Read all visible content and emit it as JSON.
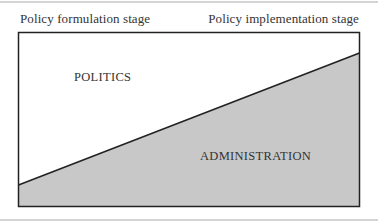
{
  "diagram": {
    "left_header": "Policy formulation stage",
    "right_header": "Policy implementation stage",
    "upper_region_label": "POLITICS",
    "lower_region_label": "ADMINISTRATION",
    "colors": {
      "upper_fill": "#ffffff",
      "lower_fill": "#c8c8c8",
      "border": "#222222",
      "rule": "#d4d4d4"
    }
  }
}
